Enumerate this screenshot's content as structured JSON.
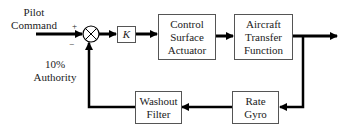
{
  "input": {
    "line1": "Pilot",
    "line2": "Command"
  },
  "signs": {
    "plus": "+",
    "minus": "−"
  },
  "authority": {
    "line1": "10%",
    "line2": "Authority"
  },
  "gain": {
    "label": "K"
  },
  "actuator": {
    "line1": "Control",
    "line2": "Surface",
    "line3": "Actuator"
  },
  "aircraft": {
    "line1": "Aircraft",
    "line2": "Transfer",
    "line3": "Function"
  },
  "rate_gyro": {
    "line1": "Rate",
    "line2": "Gyro"
  },
  "washout": {
    "line1": "Washout",
    "line2": "Filter"
  }
}
